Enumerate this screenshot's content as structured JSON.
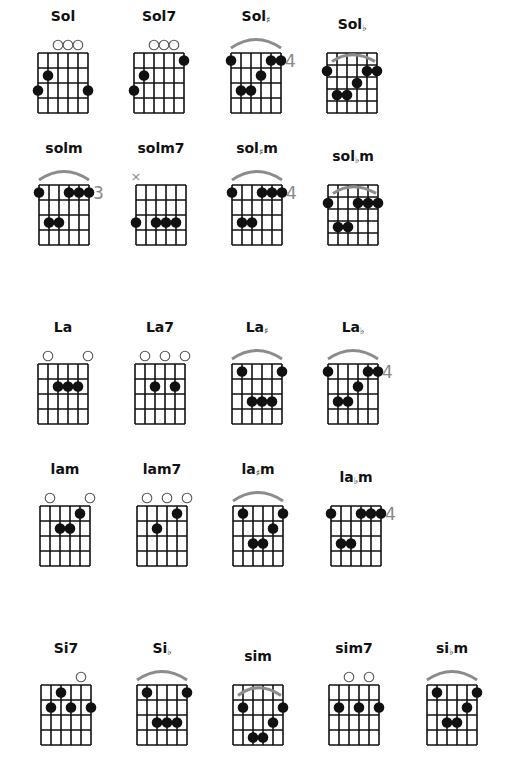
{
  "colors": {
    "ink": "#111111",
    "arc": "#8c8c8c",
    "fret_number": "#888888",
    "open": "#555555"
  },
  "chords": [
    {
      "name": "Sol",
      "accidental": "",
      "x": 38,
      "y": 53,
      "rows": 4,
      "open": [
        2,
        3,
        4
      ],
      "muted": [],
      "arc": false,
      "fret": "",
      "dots": [
        [
          1,
          2
        ],
        [
          0,
          3
        ],
        [
          5,
          3
        ]
      ]
    },
    {
      "name": "Sol7",
      "accidental": "",
      "x": 134,
      "y": 53,
      "rows": 4,
      "open": [
        2,
        3,
        4
      ],
      "muted": [],
      "arc": false,
      "fret": "",
      "dots": [
        [
          5,
          1
        ],
        [
          1,
          2
        ],
        [
          0,
          3
        ]
      ]
    },
    {
      "name": "Sol",
      "accidental": "♯",
      "x": 231,
      "y": 53,
      "rows": 4,
      "open": [],
      "muted": [],
      "arc": true,
      "fret": "4",
      "dots": [
        [
          0,
          1
        ],
        [
          4,
          1
        ],
        [
          5,
          1
        ],
        [
          3,
          2
        ],
        [
          1,
          3
        ],
        [
          2,
          3
        ]
      ]
    },
    {
      "name": "Sol",
      "accidental": "♭",
      "x": 327,
      "y": 53,
      "rows": 5,
      "open": [],
      "muted": [],
      "arc": "inside",
      "fret": "",
      "dots": [
        [
          0,
          2
        ],
        [
          4,
          2
        ],
        [
          5,
          2
        ],
        [
          3,
          3
        ],
        [
          1,
          4
        ],
        [
          2,
          4
        ]
      ]
    },
    {
      "name": "solm",
      "accidental": "",
      "x": 39,
      "y": 185,
      "rows": 4,
      "open": [],
      "muted": [],
      "arc": true,
      "fret": "3",
      "dots": [
        [
          0,
          1
        ],
        [
          3,
          1
        ],
        [
          4,
          1
        ],
        [
          5,
          1
        ],
        [
          1,
          3
        ],
        [
          2,
          3
        ]
      ]
    },
    {
      "name": "solm7",
      "accidental": "",
      "x": 136,
      "y": 185,
      "rows": 4,
      "open": [],
      "muted": [
        0
      ],
      "arc": false,
      "fret": "",
      "dots": [
        [
          0,
          3
        ],
        [
          2,
          3
        ],
        [
          3,
          3
        ],
        [
          4,
          3
        ]
      ]
    },
    {
      "name": "solm",
      "accidental": "♯",
      "x": 232,
      "y": 185,
      "rows": 4,
      "open": [],
      "muted": [],
      "arc": true,
      "fret": "4",
      "dots": [
        [
          0,
          1
        ],
        [
          3,
          1
        ],
        [
          4,
          1
        ],
        [
          5,
          1
        ],
        [
          1,
          3
        ],
        [
          2,
          3
        ]
      ]
    },
    {
      "name": "solm",
      "accidental": "♭",
      "x": 328,
      "y": 185,
      "rows": 5,
      "open": [],
      "muted": [],
      "arc": "inside",
      "fret": "",
      "dots": [
        [
          0,
          2
        ],
        [
          3,
          2
        ],
        [
          4,
          2
        ],
        [
          5,
          2
        ],
        [
          1,
          4
        ],
        [
          2,
          4
        ]
      ]
    },
    {
      "name": "La",
      "accidental": "",
      "x": 38,
      "y": 364,
      "rows": 4,
      "open": [
        1,
        5
      ],
      "muted": [],
      "arc": false,
      "fret": "",
      "dots": [
        [
          2,
          2
        ],
        [
          3,
          2
        ],
        [
          4,
          2
        ]
      ]
    },
    {
      "name": "La7",
      "accidental": "",
      "x": 135,
      "y": 364,
      "rows": 4,
      "open": [
        1,
        3,
        5
      ],
      "muted": [],
      "arc": false,
      "fret": "",
      "dots": [
        [
          2,
          2
        ],
        [
          4,
          2
        ]
      ]
    },
    {
      "name": "La",
      "accidental": "♯",
      "x": 232,
      "y": 364,
      "rows": 4,
      "open": [],
      "muted": [],
      "arc": true,
      "fret": "",
      "dots": [
        [
          1,
          1
        ],
        [
          5,
          1
        ],
        [
          2,
          3
        ],
        [
          3,
          3
        ],
        [
          4,
          3
        ]
      ]
    },
    {
      "name": "La",
      "accidental": "♭",
      "x": 328,
      "y": 364,
      "rows": 4,
      "open": [],
      "muted": [],
      "arc": true,
      "fret": "4",
      "dots": [
        [
          0,
          1
        ],
        [
          4,
          1
        ],
        [
          5,
          1
        ],
        [
          3,
          2
        ],
        [
          1,
          3
        ],
        [
          2,
          3
        ]
      ]
    },
    {
      "name": "lam",
      "accidental": "",
      "x": 40,
      "y": 506,
      "rows": 4,
      "open": [
        1,
        5
      ],
      "muted": [],
      "arc": false,
      "fret": "",
      "dots": [
        [
          4,
          1
        ],
        [
          2,
          2
        ],
        [
          3,
          2
        ]
      ]
    },
    {
      "name": "lam7",
      "accidental": "",
      "x": 137,
      "y": 506,
      "rows": 4,
      "open": [
        1,
        3,
        5
      ],
      "muted": [],
      "arc": false,
      "fret": "",
      "dots": [
        [
          4,
          1
        ],
        [
          2,
          2
        ]
      ]
    },
    {
      "name": "lam",
      "accidental": "♯",
      "x": 233,
      "y": 506,
      "rows": 4,
      "open": [],
      "muted": [],
      "arc": true,
      "fret": "",
      "dots": [
        [
          1,
          1
        ],
        [
          5,
          1
        ],
        [
          4,
          2
        ],
        [
          2,
          3
        ],
        [
          3,
          3
        ]
      ]
    },
    {
      "name": "lam",
      "accidental": "♭",
      "x": 331,
      "y": 506,
      "rows": 4,
      "open": [],
      "muted": [],
      "arc": false,
      "fret": "4",
      "dots": [
        [
          0,
          1
        ],
        [
          3,
          1
        ],
        [
          4,
          1
        ],
        [
          5,
          1
        ],
        [
          1,
          3
        ],
        [
          2,
          3
        ]
      ]
    },
    {
      "name": "Si7",
      "accidental": "",
      "x": 41,
      "y": 685,
      "rows": 4,
      "open": [
        4
      ],
      "muted": [],
      "arc": false,
      "fret": "",
      "dots": [
        [
          2,
          1
        ],
        [
          1,
          2
        ],
        [
          3,
          2
        ],
        [
          5,
          2
        ]
      ]
    },
    {
      "name": "Si",
      "accidental": "♭",
      "x": 137,
      "y": 685,
      "rows": 4,
      "open": [],
      "muted": [],
      "arc": true,
      "fret": "",
      "dots": [
        [
          1,
          1
        ],
        [
          5,
          1
        ],
        [
          2,
          3
        ],
        [
          3,
          3
        ],
        [
          4,
          3
        ]
      ]
    },
    {
      "name": "sim",
      "accidental": "",
      "x": 233,
      "y": 685,
      "rows": 4,
      "open": [],
      "muted": [],
      "arc": "inside",
      "fret": "",
      "dots": [
        [
          1,
          2
        ],
        [
          5,
          2
        ],
        [
          4,
          3
        ],
        [
          2,
          4
        ],
        [
          3,
          4
        ]
      ],
      "inside_rows": true
    },
    {
      "name": "sim7",
      "accidental": "",
      "x": 329,
      "y": 685,
      "rows": 4,
      "open": [
        2,
        4
      ],
      "muted": [],
      "arc": false,
      "fret": "",
      "dots": [
        [
          1,
          2
        ],
        [
          3,
          2
        ],
        [
          5,
          2
        ]
      ],
      "inside_rows": true
    },
    {
      "name": "sim",
      "accidental": "♭",
      "x": 427,
      "y": 685,
      "rows": 4,
      "open": [],
      "muted": [],
      "arc": true,
      "fret": "",
      "dots": [
        [
          1,
          1
        ],
        [
          5,
          1
        ],
        [
          4,
          2
        ],
        [
          2,
          3
        ],
        [
          3,
          3
        ]
      ]
    }
  ]
}
